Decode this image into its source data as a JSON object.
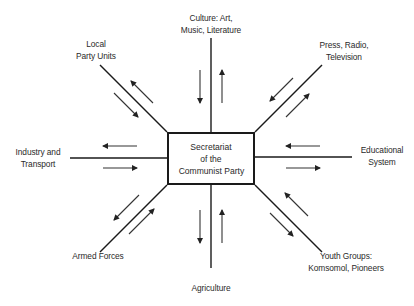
{
  "diagram": {
    "center": {
      "lines": [
        "Secretariat",
        "of the",
        "Communist Party"
      ]
    },
    "nodes": {
      "culture": {
        "lines": [
          "Culture: Art,",
          "Music, Literature"
        ],
        "position": "top"
      },
      "local_party": {
        "lines": [
          "Local",
          "Party Units"
        ],
        "position": "top-left"
      },
      "press": {
        "lines": [
          "Press, Radio,",
          "Television"
        ],
        "position": "top-right"
      },
      "industry": {
        "lines": [
          "Industry and",
          "Transport"
        ],
        "position": "left"
      },
      "education": {
        "lines": [
          "Educational",
          "System"
        ],
        "position": "right"
      },
      "armed_forces": {
        "lines": [
          "Armed Forces"
        ],
        "position": "bottom-left"
      },
      "agriculture": {
        "lines": [
          "Agriculture"
        ],
        "position": "bottom"
      },
      "youth": {
        "lines": [
          "Youth Groups:",
          "Komsomol, Pioneers"
        ],
        "position": "bottom-right"
      }
    },
    "arrow_semantics": "Each connection has a pair of arrows: one pointing toward the Secretariat and one pointing away (two-way flow).",
    "colors": {
      "line": "#1a1a1a",
      "arrow": "#333333",
      "background": "#ffffff"
    }
  }
}
